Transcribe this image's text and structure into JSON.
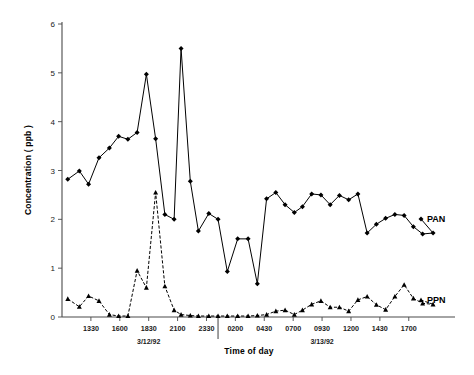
{
  "chart_data": {
    "type": "line",
    "title": "",
    "xlabel": "Time of day",
    "ylabel": "Concentration ( ppb )",
    "ylim": [
      0,
      6
    ],
    "yticks": [
      0,
      1,
      2,
      3,
      4,
      5,
      6
    ],
    "ytick_labels": [
      "0",
      "1",
      "2",
      "3",
      "4",
      "5",
      "6"
    ],
    "grid": false,
    "legend_position": "inline-right",
    "x_tick_labels": [
      "1330",
      "1600",
      "1830",
      "2100",
      "2330",
      "0200",
      "0430",
      "0700",
      "0930",
      "1200",
      "1430",
      "1700"
    ],
    "x_tick_positions": [
      5,
      10,
      15,
      20,
      25,
      30,
      35,
      40,
      45,
      50,
      55,
      60
    ],
    "xlim": [
      0,
      68
    ],
    "date_annotations": [
      {
        "label": "3/12/92",
        "x": 15
      },
      {
        "label": "3/13/92",
        "x": 45
      }
    ],
    "day_separator_x": 27,
    "series": [
      {
        "name": "PAN",
        "label": "PAN",
        "marker": "diamond",
        "linestyle": "solid",
        "color": "#000000",
        "x": [
          1.0,
          3.0,
          4.6,
          6.4,
          8.2,
          9.8,
          11.4,
          13.0,
          14.6,
          16.2,
          17.8,
          19.4,
          20.6,
          22.2,
          23.6,
          25.4,
          27.0,
          28.6,
          30.4,
          32.2,
          33.8,
          35.4,
          37.0,
          38.6,
          40.2,
          41.6,
          43.2,
          44.8,
          46.4,
          48.0,
          49.6,
          51.2,
          52.8,
          54.4,
          56.0,
          57.6,
          59.2,
          60.8,
          62.4,
          64.2
        ],
        "y": [
          2.82,
          2.99,
          2.72,
          3.26,
          3.46,
          3.7,
          3.64,
          3.78,
          4.97,
          3.65,
          2.1,
          2.0,
          5.5,
          2.78,
          1.76,
          2.12,
          2.0,
          0.93,
          1.6,
          1.6,
          0.68,
          2.42,
          2.55,
          2.3,
          2.14,
          2.26,
          2.52,
          2.5,
          2.3,
          2.49,
          2.4,
          2.52,
          1.72,
          1.9,
          2.02,
          2.1,
          2.08,
          1.85,
          1.7,
          1.72
        ]
      },
      {
        "name": "PPN",
        "label": "PPN",
        "marker": "triangle",
        "linestyle": "dashed",
        "color": "#000000",
        "x": [
          1.0,
          3.0,
          4.6,
          6.4,
          8.2,
          9.8,
          11.4,
          13.0,
          14.6,
          16.2,
          17.8,
          19.4,
          20.6,
          22.2,
          23.6,
          25.4,
          27.0,
          28.6,
          30.4,
          32.2,
          33.8,
          35.4,
          37.0,
          38.6,
          40.2,
          41.6,
          43.2,
          44.8,
          46.4,
          48.0,
          49.6,
          51.2,
          52.8,
          54.4,
          56.0,
          57.6,
          59.2,
          60.8,
          62.4,
          64.2
        ],
        "y": [
          0.37,
          0.21,
          0.43,
          0.33,
          0.05,
          0.02,
          0.02,
          0.95,
          0.6,
          2.55,
          0.63,
          0.14,
          0.05,
          0.03,
          0.02,
          0.02,
          0.02,
          0.02,
          0.02,
          0.02,
          0.03,
          0.05,
          0.12,
          0.14,
          0.05,
          0.14,
          0.26,
          0.33,
          0.2,
          0.2,
          0.12,
          0.35,
          0.42,
          0.25,
          0.15,
          0.42,
          0.66,
          0.38,
          0.28,
          0.26
        ]
      }
    ]
  },
  "labels": {
    "y_axis_title": "Concentration ( ppb )",
    "x_axis_title": "Time of day",
    "pan_series_label": "PAN",
    "ppn_series_label": "PPN",
    "date_left": "3/12/92",
    "date_right": "3/13/92"
  }
}
